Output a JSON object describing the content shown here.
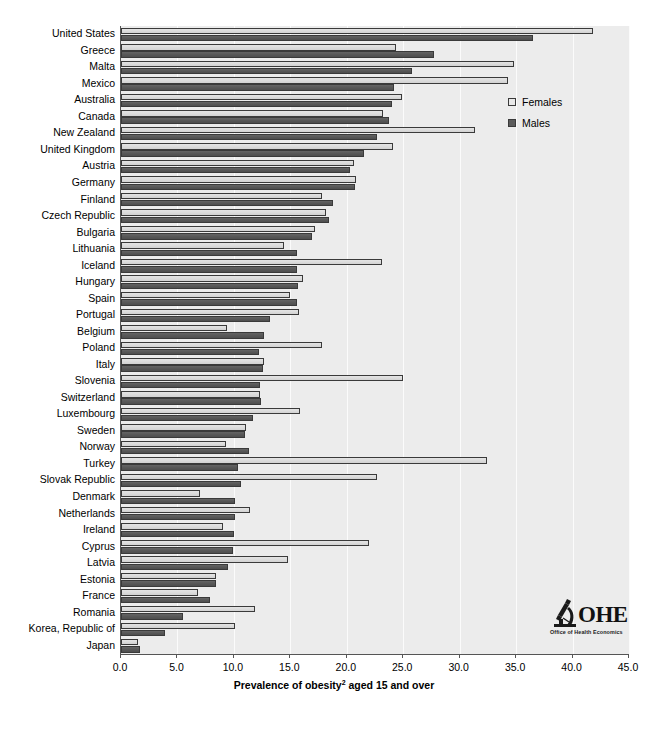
{
  "chart_data": {
    "type": "bar",
    "orientation": "horizontal",
    "title": "",
    "xlabel": "Prevalence of obesity² aged 15 and over",
    "xlabel_plain": "Prevalence of obesity aged 15 and over",
    "xlabel_footnote": "2",
    "ylabel": "",
    "xlim": [
      0.0,
      45.0
    ],
    "xticks": [
      "0.0",
      "5.0",
      "10.0",
      "15.0",
      "20.0",
      "25.0",
      "30.0",
      "35.0",
      "40.0",
      "45.0"
    ],
    "xtick_values": [
      0,
      5,
      10,
      15,
      20,
      25,
      30,
      35,
      40,
      45
    ],
    "grid": "vertical",
    "legend_position": "upper-right-inside",
    "categories": [
      "United States",
      "Greece",
      "Malta",
      "Mexico",
      "Australia",
      "Canada",
      "New Zealand",
      "United Kingdom",
      "Austria",
      "Germany",
      "Finland",
      "Czech Republic",
      "Bulgaria",
      "Lithuania",
      "Iceland",
      "Hungary",
      "Spain",
      "Portugal",
      "Belgium",
      "Poland",
      "Italy",
      "Slovenia",
      "Switzerland",
      "Luxembourg",
      "Sweden",
      "Norway",
      "Turkey",
      "Slovak Republic",
      "Denmark",
      "Netherlands",
      "Ireland",
      "Cyprus",
      "Latvia",
      "Estonia",
      "France",
      "Romania",
      "Korea, Republic of",
      "Japan"
    ],
    "series": [
      {
        "name": "Females",
        "color": "#e0e0e0",
        "values": [
          41.8,
          24.4,
          34.8,
          34.3,
          24.9,
          23.2,
          31.4,
          24.1,
          20.6,
          20.8,
          17.8,
          18.2,
          17.2,
          14.4,
          23.1,
          16.1,
          15.0,
          15.8,
          9.4,
          17.8,
          12.7,
          25.0,
          12.3,
          15.9,
          11.1,
          9.3,
          32.4,
          22.7,
          7.0,
          11.4,
          9.0,
          22.0,
          14.8,
          8.4,
          6.8,
          11.9,
          10.1,
          1.5
        ]
      },
      {
        "name": "Males",
        "color": "#5c5c5c",
        "values": [
          36.5,
          27.7,
          25.8,
          24.2,
          24.0,
          23.7,
          22.7,
          21.5,
          20.3,
          20.7,
          18.8,
          18.4,
          16.9,
          15.6,
          15.6,
          15.7,
          15.6,
          13.2,
          12.7,
          12.2,
          12.6,
          12.3,
          12.4,
          11.7,
          11.0,
          11.3,
          10.4,
          10.6,
          10.1,
          10.1,
          10.0,
          9.9,
          9.5,
          8.4,
          7.9,
          5.5,
          3.9,
          1.7
        ]
      }
    ]
  },
  "legend": {
    "items": [
      {
        "label": "Females",
        "swatch": "light-square"
      },
      {
        "label": "Males",
        "swatch": "dark-square"
      }
    ]
  },
  "logo": {
    "wordmark": "OHE",
    "tagline": "Office of Health Economics",
    "mark_icon": "microscope-icon"
  }
}
